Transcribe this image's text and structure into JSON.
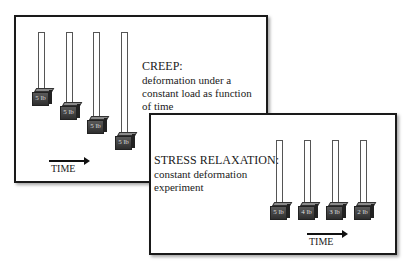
{
  "creep": {
    "title": "CREEP:",
    "description": [
      "deformation under a",
      "constant load as function",
      "of time"
    ],
    "time_label": "TIME",
    "weights": [
      "5 lb",
      "5 lb",
      "5 lb",
      "5 lb"
    ]
  },
  "relaxation": {
    "title": "STRESS RELAXATION:",
    "description": [
      "constant deformation",
      "experiment"
    ],
    "time_label": "TIME",
    "weights": [
      "5 lb",
      "4 lb",
      "3 lb",
      "2 lb"
    ]
  }
}
